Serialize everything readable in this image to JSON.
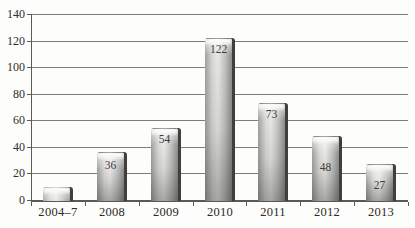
{
  "chart_data": {
    "type": "bar",
    "title": "",
    "xlabel": "",
    "ylabel": "",
    "categories": [
      "2004–7",
      "2008",
      "2009",
      "2010",
      "2011",
      "2012",
      "2013"
    ],
    "values": [
      10,
      36,
      54,
      122,
      73,
      48,
      27
    ],
    "value_labels": [
      "",
      "36",
      "54",
      "122",
      "73",
      "48",
      "27"
    ],
    "value_label_top_offsets_px": [
      null,
      6,
      4,
      4,
      4,
      24,
      14
    ],
    "ylim": [
      0,
      140
    ],
    "ytick_step": 20,
    "ytick_labels": [
      "0",
      "20",
      "40",
      "60",
      "80",
      "100",
      "120",
      "140"
    ],
    "grid": "horizontal",
    "legend": "none",
    "colors": {
      "background": "#fdfdfb",
      "gridline": "#7d7d7d",
      "axis": "#5a5a58",
      "bar_light": "#e7e7e5",
      "bar_dark": "#8d8d8b",
      "bar_shadow": "#3f3f3c",
      "text": "#2a2a28",
      "value_text": "#3d3d3b"
    }
  }
}
